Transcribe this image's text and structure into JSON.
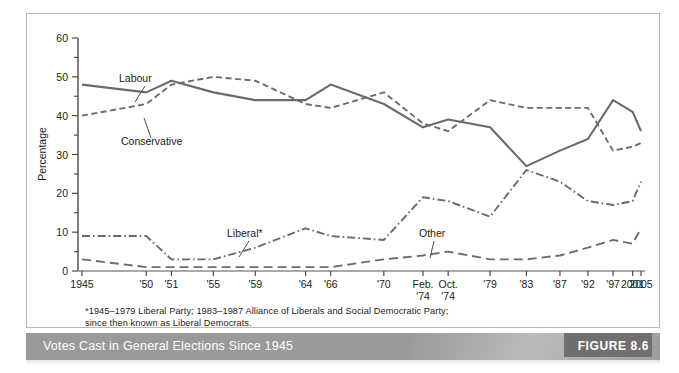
{
  "figure": {
    "caption": "Votes Cast in General Elections Since 1945",
    "figure_tag": "FIGURE 8.6",
    "footnote_line1": "*1945–1979 Liberal Party; 1983–1987 Alliance of Liberals and Social Democratic Party;",
    "footnote_line2": "since then known as Liberal Democrats.",
    "caption_bar_color": "#9a9a9a",
    "tag_box_color": "#6f6f6f",
    "line_color": "#6b6b6b"
  },
  "chart_data": {
    "type": "line",
    "title": "Votes Cast in General Elections Since 1945",
    "xlabel": "",
    "ylabel": "Percentage",
    "ylim": [
      0,
      60
    ],
    "ytick_step": 10,
    "yticks": [
      0,
      10,
      20,
      30,
      40,
      50,
      60
    ],
    "minor_ytick_step": 5,
    "grid": false,
    "legend_position": "inline-annotations",
    "categories": [
      "1945",
      "'50",
      "'51",
      "'55",
      "'59",
      "'64",
      "'66",
      "'70",
      "Feb. '74",
      "Oct. '74",
      "'79",
      "'83",
      "'87",
      "'92",
      "'97",
      "2001",
      "2005"
    ],
    "xtick_labels": [
      "1945",
      "'50",
      "'51",
      "'55",
      "'59",
      "'64",
      "'66",
      "'70",
      "Feb.\n'74",
      "Oct.\n'74",
      "'79",
      "'83",
      "'87",
      "'92",
      "'97",
      "2001",
      "2005"
    ],
    "series": [
      {
        "name": "Labour",
        "style": "solid",
        "values": [
          48,
          46,
          49,
          46,
          44,
          44,
          48,
          43,
          37,
          39,
          37,
          27,
          31,
          34,
          44,
          41,
          36
        ]
      },
      {
        "name": "Conservative",
        "style": "dashed",
        "values": [
          40,
          43,
          48,
          50,
          49,
          43,
          42,
          46,
          38,
          36,
          44,
          42,
          42,
          42,
          31,
          32,
          33
        ]
      },
      {
        "name": "Liberal*",
        "style": "dash-dot",
        "values": [
          9,
          9,
          3,
          3,
          6,
          11,
          9,
          8,
          19,
          18,
          14,
          26,
          23,
          18,
          17,
          18,
          23
        ]
      },
      {
        "name": "Other",
        "style": "long-dash",
        "values": [
          3,
          1,
          1,
          1,
          1,
          1,
          1,
          3,
          4,
          5,
          3,
          3,
          4,
          6,
          8,
          7,
          11
        ]
      }
    ],
    "annotations": [
      {
        "text": "Labour",
        "series": "Labour"
      },
      {
        "text": "Conservative",
        "series": "Conservative"
      },
      {
        "text": "Liberal*",
        "series": "Liberal*"
      },
      {
        "text": "Other",
        "series": "Other"
      }
    ]
  }
}
